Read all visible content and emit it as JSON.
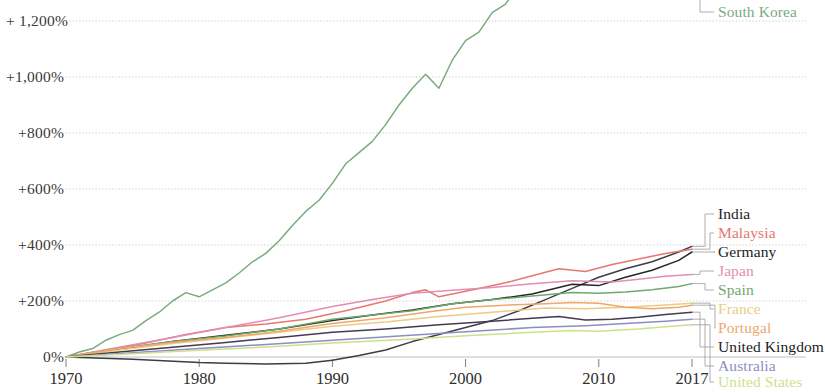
{
  "chart_data": {
    "type": "line",
    "title": "",
    "subtitle": "",
    "xlabel": "",
    "ylabel": "",
    "xlim": [
      1970,
      2017
    ],
    "ylim": [
      -60,
      1260
    ],
    "grid": true,
    "grid_axis": "y",
    "legend_position": "right-inline-labels",
    "y_tick_values": [
      1200,
      1000,
      800,
      600,
      400,
      200,
      0
    ],
    "y_tick_labels": [
      "+ 1,200%",
      "+1,000%",
      "+800%",
      "+600%",
      "+400%",
      "+200%",
      "0%"
    ],
    "x_tick_values": [
      1970,
      1980,
      1990,
      2000,
      2010,
      2017
    ],
    "x_tick_labels": [
      "1970",
      "1980",
      "1990",
      "2000",
      "2010",
      "2017"
    ],
    "series": [
      {
        "name": "South Korea",
        "color": "#7aab7e",
        "label_color": "#7aab7e",
        "label_y": 17,
        "x": [
          1970,
          1971,
          1972,
          1973,
          1974,
          1975,
          1976,
          1977,
          1978,
          1979,
          1980,
          1981,
          1982,
          1983,
          1984,
          1985,
          1986,
          1987,
          1988,
          1989,
          1990,
          1991,
          1992,
          1993,
          1994,
          1995,
          1996,
          1997,
          1998,
          1999,
          2000,
          2001,
          2002,
          2003,
          2004,
          2005,
          2006,
          2007,
          2008,
          2009,
          2010,
          2011,
          2012,
          2013,
          2014,
          2015,
          2016,
          2017
        ],
        "values": [
          0,
          18,
          30,
          60,
          80,
          95,
          130,
          160,
          200,
          230,
          215,
          240,
          265,
          300,
          340,
          370,
          415,
          470,
          520,
          560,
          620,
          690,
          730,
          770,
          830,
          900,
          960,
          1010,
          960,
          1060,
          1130,
          1160,
          1230,
          1260,
          1330,
          1390,
          1450,
          1520,
          1540,
          1550,
          1640,
          1680,
          1700,
          1730,
          1790,
          1830,
          1870,
          1860
        ]
      },
      {
        "name": "India",
        "color": "#3c3c4a",
        "label_color": "#1c1c1c",
        "label_y": 219,
        "x": [
          1970,
          1975,
          1980,
          1982,
          1985,
          1988,
          1990,
          1992,
          1994,
          1996,
          1998,
          2000,
          2002,
          2004,
          2006,
          2008,
          2010,
          2012,
          2014,
          2016,
          2017
        ],
        "values": [
          0,
          -8,
          -20,
          -22,
          -25,
          -22,
          -12,
          5,
          25,
          55,
          80,
          105,
          130,
          165,
          205,
          245,
          285,
          315,
          340,
          375,
          395
        ]
      },
      {
        "name": "Malaysia",
        "color": "#e8776f",
        "label_color": "#e8776f",
        "label_y": 238,
        "x": [
          1970,
          1973,
          1976,
          1979,
          1982,
          1985,
          1988,
          1991,
          1994,
          1996,
          1997,
          1998,
          1999,
          2001,
          2003,
          2005,
          2007,
          2009,
          2011,
          2013,
          2015,
          2017
        ],
        "values": [
          0,
          25,
          50,
          80,
          105,
          118,
          135,
          165,
          200,
          230,
          240,
          215,
          225,
          245,
          265,
          290,
          315,
          305,
          330,
          350,
          370,
          385
        ]
      },
      {
        "name": "Germany",
        "color": "#262626",
        "label_color": "#1c1c1c",
        "label_y": 257,
        "x": [
          1970,
          1974,
          1978,
          1982,
          1986,
          1990,
          1993,
          1996,
          1999,
          2002,
          2005,
          2008,
          2010,
          2012,
          2014,
          2016,
          2017
        ],
        "values": [
          0,
          28,
          55,
          78,
          100,
          130,
          150,
          168,
          190,
          205,
          225,
          260,
          255,
          285,
          310,
          345,
          375
        ]
      },
      {
        "name": "Japan",
        "color": "#e48cb4",
        "label_color": "#e48cb4",
        "label_y": 276,
        "x": [
          1970,
          1974,
          1978,
          1982,
          1986,
          1990,
          1993,
          1996,
          1999,
          2002,
          2005,
          2008,
          2011,
          2013,
          2015,
          2017
        ],
        "values": [
          0,
          35,
          70,
          105,
          140,
          180,
          205,
          228,
          238,
          248,
          262,
          272,
          268,
          278,
          288,
          295
        ]
      },
      {
        "name": "Spain",
        "color": "#6fa86c",
        "label_color": "#6fa86c",
        "label_y": 295,
        "x": [
          1970,
          1974,
          1978,
          1982,
          1986,
          1990,
          1993,
          1996,
          1999,
          2002,
          2005,
          2008,
          2010,
          2012,
          2014,
          2016,
          2017
        ],
        "values": [
          0,
          30,
          55,
          75,
          100,
          135,
          150,
          165,
          190,
          205,
          218,
          230,
          228,
          232,
          240,
          252,
          262
        ]
      },
      {
        "name": "France",
        "color": "#edcb84",
        "label_color": "#edcb84",
        "label_y": 314,
        "x": [
          1970,
          1974,
          1978,
          1982,
          1986,
          1990,
          1994,
          1998,
          2002,
          2006,
          2009,
          2012,
          2015,
          2017
        ],
        "values": [
          0,
          25,
          48,
          68,
          88,
          110,
          125,
          145,
          160,
          175,
          172,
          178,
          186,
          192
        ]
      },
      {
        "name": "Portugal",
        "color": "#f0a86a",
        "label_color": "#f0a86a",
        "label_y": 333,
        "x": [
          1970,
          1974,
          1978,
          1982,
          1986,
          1990,
          1994,
          1997,
          2000,
          2003,
          2006,
          2008,
          2010,
          2012,
          2014,
          2016,
          2017
        ],
        "values": [
          0,
          30,
          52,
          70,
          92,
          120,
          140,
          160,
          178,
          185,
          190,
          195,
          192,
          178,
          172,
          178,
          185
        ]
      },
      {
        "name": "United Kingdom",
        "color": "#453a52",
        "label_color": "#1c1c1c",
        "label_y": 352,
        "x": [
          1970,
          1974,
          1978,
          1982,
          1986,
          1990,
          1994,
          1998,
          2002,
          2005,
          2007,
          2009,
          2011,
          2013,
          2015,
          2017
        ],
        "values": [
          0,
          18,
          35,
          52,
          70,
          88,
          100,
          115,
          128,
          138,
          145,
          132,
          135,
          142,
          152,
          160
        ]
      },
      {
        "name": "Australia",
        "color": "#8a8fc4",
        "label_color": "#8a8fc4",
        "label_y": 371,
        "x": [
          1970,
          1975,
          1980,
          1985,
          1990,
          1995,
          2000,
          2005,
          2009,
          2012,
          2015,
          2017
        ],
        "values": [
          0,
          15,
          30,
          45,
          60,
          75,
          90,
          105,
          112,
          120,
          128,
          135
        ]
      },
      {
        "name": "United States",
        "color": "#cfe08a",
        "label_color": "#cfe08a",
        "label_y": 387,
        "x": [
          1970,
          1975,
          1980,
          1985,
          1990,
          1995,
          2000,
          2005,
          2008,
          2010,
          2013,
          2015,
          2017
        ],
        "values": [
          0,
          12,
          24,
          36,
          50,
          62,
          76,
          88,
          95,
          92,
          100,
          108,
          115
        ]
      }
    ]
  }
}
